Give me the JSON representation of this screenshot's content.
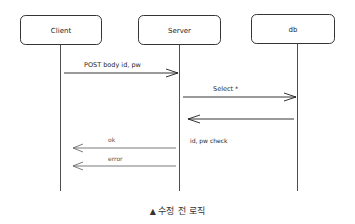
{
  "diagram": {
    "type": "sequence",
    "actors": [
      {
        "id": "client",
        "label": "Client"
      },
      {
        "id": "server",
        "label": "Server"
      },
      {
        "id": "db",
        "label": "db"
      }
    ],
    "messages": [
      {
        "from": "client",
        "to": "server",
        "label": "POST body id, pw",
        "style": "solid"
      },
      {
        "from": "server",
        "to": "db",
        "label": "Select *",
        "style": "solid"
      },
      {
        "from": "db",
        "to": "server",
        "label": "",
        "style": "solid"
      },
      {
        "from": "server",
        "to": "client",
        "label": "ok",
        "style": "light"
      },
      {
        "from": "server",
        "to": "client",
        "label": "error",
        "style": "light"
      }
    ],
    "notes": [
      {
        "on": "server",
        "label": "id, pw check"
      }
    ],
    "colors": {
      "stroke": "#1e1e1e",
      "return_stroke": "#6b6b6b",
      "background": "#ffffff"
    }
  },
  "caption": {
    "marker": "▲",
    "text": "수정 전 로직"
  }
}
